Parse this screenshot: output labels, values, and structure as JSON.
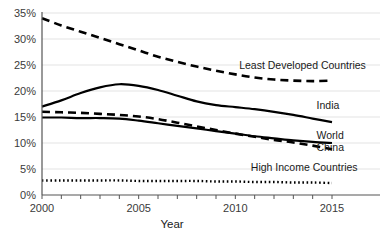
{
  "chart_data": {
    "type": "line",
    "title": "",
    "xlabel": "Year",
    "ylabel": "",
    "xlim": [
      2000,
      2015
    ],
    "ylim": [
      0,
      35
    ],
    "grid": true,
    "legend_position": "inline-right-labels",
    "x": [
      2000,
      2001,
      2002,
      2003,
      2004,
      2005,
      2006,
      2007,
      2008,
      2009,
      2010,
      2011,
      2012,
      2013,
      2014,
      2015
    ],
    "xticks": [
      2000,
      2001,
      2002,
      2003,
      2004,
      2005,
      2006,
      2007,
      2008,
      2009,
      2010,
      2011,
      2012,
      2013,
      2014,
      2015
    ],
    "xtick_labels_shown": [
      "2000",
      "2005",
      "2010",
      "2015"
    ],
    "yticks": [
      0,
      5,
      10,
      15,
      20,
      25,
      30,
      35
    ],
    "ytick_labels": [
      "0%",
      "5%",
      "10%",
      "15%",
      "20%",
      "25%",
      "30%",
      "35%"
    ],
    "series": [
      {
        "name": "Least Developed Countries",
        "style": "dashed",
        "values": [
          34.0,
          32.6,
          31.4,
          30.2,
          29.0,
          27.8,
          26.6,
          25.6,
          24.7,
          23.9,
          23.2,
          22.6,
          22.2,
          22.0,
          21.9,
          22.0
        ]
      },
      {
        "name": "India",
        "style": "solid",
        "values": [
          17.0,
          18.2,
          19.6,
          20.7,
          21.3,
          21.0,
          20.2,
          19.1,
          18.0,
          17.3,
          16.9,
          16.5,
          16.0,
          15.4,
          14.7,
          14.0
        ]
      },
      {
        "name": "China",
        "style": "dashed",
        "values": [
          16.0,
          15.9,
          15.8,
          15.6,
          15.4,
          15.1,
          14.6,
          13.9,
          13.2,
          12.5,
          11.8,
          11.2,
          10.6,
          10.1,
          9.5,
          8.8
        ]
      },
      {
        "name": "World",
        "style": "solid",
        "values": [
          14.9,
          14.9,
          14.8,
          14.8,
          14.7,
          14.3,
          13.8,
          13.3,
          12.8,
          12.3,
          11.8,
          11.3,
          10.9,
          10.5,
          10.2,
          10.0
        ]
      },
      {
        "name": "High Income Countries",
        "style": "dotted",
        "values": [
          2.8,
          2.8,
          2.8,
          2.8,
          2.8,
          2.7,
          2.7,
          2.7,
          2.7,
          2.6,
          2.6,
          2.5,
          2.5,
          2.4,
          2.4,
          2.3
        ]
      }
    ],
    "annotations": [
      {
        "text": "Least Developed Countries",
        "x": 2010.2,
        "y": 24.2
      },
      {
        "text": "India",
        "x": 2014.2,
        "y": 16.6
      },
      {
        "text": "World",
        "x": 2014.2,
        "y": 10.7
      },
      {
        "text": "China",
        "x": 2014.2,
        "y": 8.4
      },
      {
        "text": "High Income Countries",
        "x": 2010.8,
        "y": 4.6
      }
    ]
  }
}
